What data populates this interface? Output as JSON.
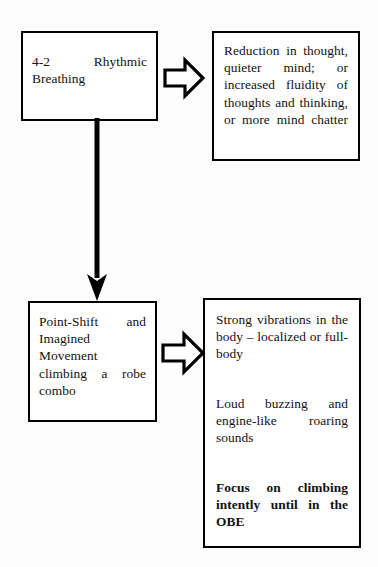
{
  "diagram": {
    "background_color": "#fdfdfd",
    "line_color": "#000000",
    "box_fill_color": "#ffffff",
    "nodes": [
      {
        "id": "rhythmic-breathing",
        "paragraphs": [
          "4-2 Rhythmic Breathing"
        ],
        "bold": [
          false
        ]
      },
      {
        "id": "reduction-thought",
        "paragraphs": [
          "Reduction in thought, quieter mind; or increased fluidity of thoughts and thinking, or more mind chatter"
        ],
        "bold": [
          false
        ]
      },
      {
        "id": "point-shift",
        "paragraphs": [
          "Point-Shift and Imagined Movement climbing a robe combo"
        ],
        "bold": [
          false
        ]
      },
      {
        "id": "strong-vibrations",
        "paragraphs": [
          "Strong vibrations in the body – localized or full-body",
          "Loud buzzing and engine-like roaring sounds",
          "Focus on climbing intently until in the OBE"
        ],
        "bold": [
          false,
          false,
          true
        ]
      }
    ],
    "connectors": [
      {
        "id": "breathing-to-reduction",
        "style": "block-arrow",
        "direction": "right"
      },
      {
        "id": "breathing-to-pointshift",
        "style": "line-arrow",
        "direction": "down"
      },
      {
        "id": "pointshift-to-vibrations",
        "style": "block-arrow",
        "direction": "right"
      }
    ]
  }
}
